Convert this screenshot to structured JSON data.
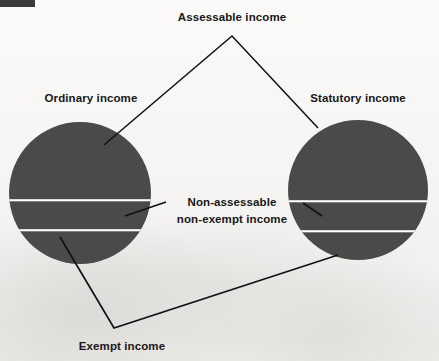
{
  "diagram": {
    "title_bar": {
      "present": true,
      "color": "#3b3b3b"
    },
    "background_color": "#f6f5f3",
    "shape_color": "#4a4a4a",
    "divider_color": "#ffffff",
    "line_color": "#111111",
    "labels": {
      "assessable": "Assessable income",
      "ordinary": "Ordinary income",
      "statutory": "Statutory income",
      "non_assessable_line1": "Non-assessable",
      "non_assessable_line2": "non-exempt income",
      "exempt": "Exempt income"
    },
    "circles": [
      {
        "name": "ordinary-income-circle",
        "label": "Ordinary income",
        "cx": 80,
        "cy": 193,
        "r": 71,
        "segments": [
          {
            "name": "assessable",
            "from_y": 122,
            "to_y": 200
          },
          {
            "name": "non-assessable-non-exempt",
            "from_y": 200,
            "to_y": 230
          },
          {
            "name": "exempt",
            "from_y": 230,
            "to_y": 264
          }
        ]
      },
      {
        "name": "statutory-income-circle",
        "label": "Statutory income",
        "cx": 358,
        "cy": 190,
        "r": 70,
        "segments": [
          {
            "name": "assessable",
            "from_y": 120,
            "to_y": 201
          },
          {
            "name": "non-assessable-non-exempt",
            "from_y": 201,
            "to_y": 231
          },
          {
            "name": "exempt",
            "from_y": 231,
            "to_y": 260
          }
        ]
      }
    ],
    "connectors": [
      {
        "name": "assessable-leader",
        "points": "104,145 232,36 318,128"
      },
      {
        "name": "non-assessable-left-leader",
        "points": "166,202 125,216"
      },
      {
        "name": "non-assessable-right-leader",
        "points": "303,203 322,216"
      },
      {
        "name": "exempt-leader",
        "points": "60,237 114,328 338,255"
      }
    ]
  }
}
